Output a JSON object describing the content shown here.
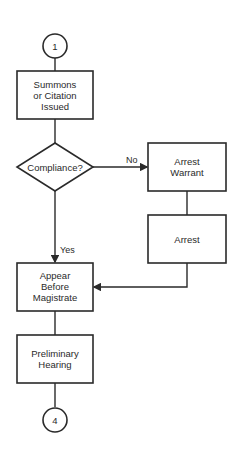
{
  "flowchart": {
    "start_connector": "1",
    "end_connector": "4",
    "nodes": {
      "summons": {
        "lines": [
          "Summons",
          "or Citation",
          "Issued"
        ]
      },
      "compliance": {
        "lines": [
          "Compliance?"
        ]
      },
      "warrant": {
        "lines": [
          "Arrest",
          "Warrant"
        ]
      },
      "arrest": {
        "lines": [
          "Arrest"
        ]
      },
      "appear": {
        "lines": [
          "Appear",
          "Before",
          "Magistrate"
        ]
      },
      "hearing": {
        "lines": [
          "Preliminary",
          "Hearing"
        ]
      }
    },
    "edge_labels": {
      "no": "No",
      "yes": "Yes"
    },
    "colors": {
      "stroke": "#2a2a2a",
      "background": "#ffffff"
    }
  }
}
